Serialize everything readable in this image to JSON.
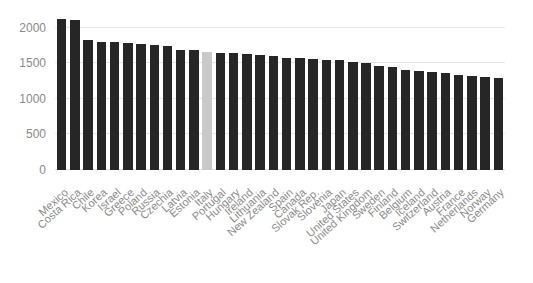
{
  "chart_data": {
    "type": "bar",
    "title": "",
    "subtitle": "",
    "xlabel": "",
    "ylabel": "",
    "ylim": [
      0,
      2500
    ],
    "yticks": [
      0,
      500,
      1000,
      1500,
      2000,
      2500
    ],
    "ytick_labels": [
      "0",
      "500",
      "1000",
      "1500",
      "2000",
      "2500"
    ],
    "grid": true,
    "legend": "none",
    "bar_color": "#262626",
    "highlight_color": "#c9c9c9",
    "highlight_category": "Italy",
    "gridline_color": "#e6e6e6",
    "tick_label_color": "#8a8a8a",
    "categories": [
      "Mexico",
      "Costa Rica",
      "Chile",
      "Korea",
      "Israel",
      "Greece",
      "Poland",
      "Russia",
      "Czechia",
      "Latvia",
      "Estonia",
      "Italy",
      "Portugal",
      "Hungary",
      "Ireland",
      "Lithuania",
      "New Zealand",
      "Spain",
      "Canada",
      "Slovak Rep.",
      "Slovenia",
      "Japan",
      "United States",
      "United Kingdom",
      "Sweden",
      "Finland",
      "Belgium",
      "Iceland",
      "Switzerland",
      "Austria",
      "France",
      "Netherlands",
      "Norway",
      "Germany"
    ],
    "values": [
      2124,
      2100,
      1830,
      1800,
      1795,
      1780,
      1770,
      1760,
      1740,
      1690,
      1680,
      1660,
      1650,
      1640,
      1630,
      1620,
      1600,
      1580,
      1570,
      1560,
      1550,
      1540,
      1520,
      1500,
      1460,
      1440,
      1400,
      1390,
      1375,
      1360,
      1340,
      1320,
      1300,
      1290
    ]
  }
}
